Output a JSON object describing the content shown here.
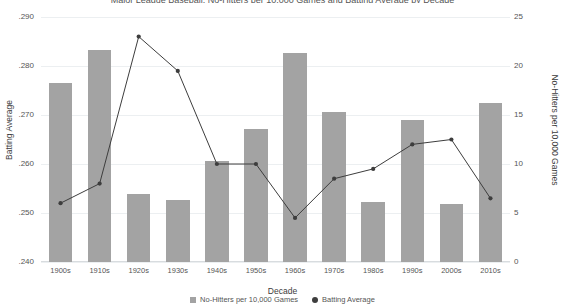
{
  "chart_data": {
    "type": "bar",
    "title": "Major League Baseball: No-Hitters per 10,000 Games and Batting Average by Decade",
    "xlabel": "Decade",
    "ylabel": "Batting Average",
    "y2label": "No-Hitters per 10,000 Games",
    "categories": [
      "1900s",
      "1910s",
      "1920s",
      "1930s",
      "1940s",
      "1950s",
      "1960s",
      "1970s",
      "1980s",
      "1990s",
      "2000s",
      "2010s"
    ],
    "ylim": [
      240,
      290
    ],
    "y2lim": [
      0,
      25
    ],
    "yticks": [
      ".240",
      ".250",
      ".260",
      ".270",
      ".280",
      ".290"
    ],
    "y2ticks": [
      "0",
      "5",
      "10",
      "15",
      "20",
      "25"
    ],
    "grid": true,
    "legend_position": "bottom",
    "series": [
      {
        "name": "No-Hitters per 10,000 Games",
        "type": "bar",
        "axis": "right",
        "color": "#a3a3a3",
        "values": [
          18.3,
          21.6,
          6.9,
          6.3,
          10.3,
          13.6,
          21.3,
          15.3,
          6.1,
          14.5,
          5.9,
          16.2
        ]
      },
      {
        "name": "Batting Average",
        "type": "line",
        "axis": "left",
        "color": "#3d3d3d",
        "values": [
          252,
          256,
          286,
          279,
          260,
          260,
          249,
          257,
          259,
          264,
          265,
          253
        ]
      }
    ]
  },
  "legend": {
    "items": [
      {
        "label": "No-Hitters per 10,000 Games",
        "marker": "bar-swatch-icon"
      },
      {
        "label": "Batting Average",
        "marker": "dot-swatch-icon"
      }
    ]
  }
}
